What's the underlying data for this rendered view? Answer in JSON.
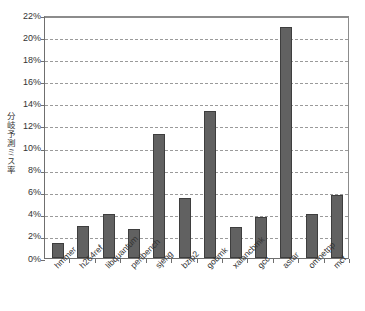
{
  "chart_data": {
    "type": "bar",
    "title": "",
    "subtitle": "",
    "xlabel": "",
    "ylabel": "分岐予測ミス率",
    "categories": [
      "hmmer",
      "h264ref",
      "libquantum",
      "perlbench",
      "sjeng",
      "bzip2",
      "gobmk",
      "xalancbmk",
      "gcc",
      "astar",
      "omnetpp",
      "mcf"
    ],
    "values": [
      1.4,
      2.9,
      4.0,
      2.65,
      11.2,
      5.45,
      13.3,
      2.8,
      3.7,
      20.9,
      4.0,
      5.75
    ],
    "value_unit": "%",
    "ylim": [
      0,
      22
    ],
    "ytick_labels": [
      "0%",
      "2%",
      "4%",
      "6%",
      "8%",
      "10%",
      "12%",
      "14%",
      "16%",
      "18%",
      "20%",
      "22%"
    ],
    "ytick_values": [
      0,
      2,
      4,
      6,
      8,
      10,
      12,
      14,
      16,
      18,
      20,
      22
    ],
    "ytick_step": 2,
    "grid": true,
    "grid_axis": "y",
    "grid_style": "dashed",
    "legend": false,
    "legend_position": "none",
    "bar_color": "#616161",
    "bar_edge_color": "#3e3e3e",
    "grid_color": "#9a9a9a",
    "axis_color": "#6f6f6f",
    "background_color": "#ffffff",
    "xtick_label_rotation": -45
  }
}
